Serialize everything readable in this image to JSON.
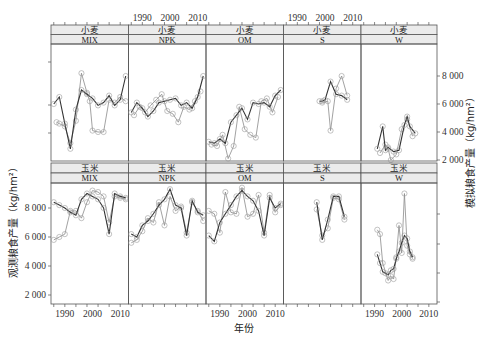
{
  "chart_data": {
    "type": "line",
    "title": "",
    "xlabel": "年份",
    "ylabel_left": "观测粮食产量（kg/hm²）",
    "ylabel_right": "模拟粮食产量（kg/hm²）",
    "x_ticks": [
      1990,
      2000,
      2010
    ],
    "x_tick_labels": [
      "1990",
      "2000",
      "2010"
    ],
    "xlim": [
      1985,
      2013
    ],
    "y_ticks": [
      2000,
      4000,
      6000,
      8000
    ],
    "y_tick_labels": [
      "2 000",
      "4 000",
      "6 000",
      "8 000"
    ],
    "legend": [],
    "series_note": "Dark line with circles = observed; light line with circles = simulated",
    "panels": [
      {
        "crop": "小麦",
        "treatment": "MIX",
        "row": 0,
        "col": 0,
        "observed": {
          "x": [
            1986,
            1988,
            1990,
            1992,
            1994,
            1996,
            1998,
            2000,
            2002,
            2004,
            2006,
            2008,
            2010,
            2012
          ],
          "y": [
            6000,
            6500,
            4600,
            2800,
            5600,
            7000,
            6700,
            6400,
            5900,
            6100,
            6600,
            5900,
            6300,
            8000
          ]
        },
        "simulated": {
          "x": [
            1987,
            1988,
            1990,
            1992,
            1994,
            1996,
            1998,
            1999,
            2000,
            2002,
            2004,
            2006,
            2008,
            2010,
            2012
          ],
          "y": [
            4700,
            4600,
            4400,
            3200,
            4800,
            8200,
            6800,
            6200,
            4100,
            4000,
            4000,
            6300,
            6100,
            6500,
            6200
          ]
        }
      },
      {
        "crop": "小麦",
        "treatment": "NPK",
        "row": 0,
        "col": 1,
        "observed": {
          "x": [
            1986,
            1988,
            1990,
            1992,
            1994,
            1996,
            1998,
            2000,
            2002,
            2004,
            2006,
            2008,
            2010,
            2012
          ],
          "y": [
            5400,
            6100,
            5700,
            5100,
            5500,
            6100,
            6200,
            6300,
            6400,
            5900,
            6100,
            5700,
            6500,
            8000
          ]
        },
        "simulated": {
          "x": [
            1987,
            1989,
            1991,
            1993,
            1995,
            1997,
            1999,
            2001,
            2003,
            2005,
            2007,
            2009,
            2011
          ],
          "y": [
            5200,
            5800,
            5400,
            5900,
            6300,
            6700,
            5500,
            5300,
            4700,
            5800,
            5600,
            6200,
            6900
          ]
        }
      },
      {
        "crop": "小麦",
        "treatment": "OM",
        "row": 0,
        "col": 2,
        "observed": {
          "x": [
            1986,
            1988,
            1990,
            1992,
            1994,
            1996,
            1998,
            2000,
            2002,
            2004,
            2006,
            2008,
            2010,
            2012
          ],
          "y": [
            3300,
            3200,
            3500,
            3200,
            4700,
            5200,
            5700,
            4900,
            6100,
            6000,
            6100,
            5800,
            6600,
            7000
          ]
        },
        "simulated": {
          "x": [
            1987,
            1989,
            1991,
            1993,
            1995,
            1997,
            1999,
            2001,
            2003,
            2005,
            2007,
            2009,
            2011
          ],
          "y": [
            3100,
            3000,
            3800,
            2100,
            3000,
            5800,
            4200,
            3800,
            3600,
            6200,
            6400,
            5400,
            6500
          ]
        }
      },
      {
        "crop": "小麦",
        "treatment": "S",
        "row": 0,
        "col": 3,
        "observed": {
          "x": [
            1998,
            1999,
            2000,
            2002,
            2004,
            2006,
            2008
          ],
          "y": [
            6200,
            6200,
            6300,
            7600,
            6700,
            6600,
            6300
          ]
        },
        "simulated": {
          "x": [
            1999,
            2001,
            2002,
            2004,
            2006,
            2008
          ],
          "y": [
            6100,
            6200,
            4100,
            7100,
            8000,
            6600
          ]
        }
      },
      {
        "crop": "小麦",
        "treatment": "W",
        "row": 0,
        "col": 4,
        "observed": {
          "x": [
            1991,
            1993,
            1994,
            1995,
            1997,
            1999,
            2001,
            2002,
            2003,
            2005
          ],
          "y": [
            2800,
            4400,
            2700,
            2900,
            2600,
            2700,
            4500,
            5100,
            4400,
            3900
          ]
        },
        "simulated": {
          "x": [
            1992,
            1994,
            1995,
            1996,
            1998,
            2000,
            2002,
            2004
          ],
          "y": [
            2500,
            3100,
            2800,
            2000,
            2400,
            4200,
            4900,
            3700
          ]
        }
      },
      {
        "crop": "玉米",
        "treatment": "MIX",
        "row": 1,
        "col": 0,
        "observed": {
          "x": [
            1986,
            1988,
            1990,
            1992,
            1994,
            1996,
            1998,
            2000,
            2002,
            2004,
            2006,
            2008,
            2010,
            2012
          ],
          "y": [
            8400,
            8200,
            8000,
            7700,
            7500,
            8600,
            9000,
            8800,
            8600,
            8000,
            6200,
            9000,
            8800,
            8700
          ]
        },
        "simulated": {
          "x": [
            1986,
            1988,
            1990,
            1992,
            1994,
            1996,
            1998,
            2000,
            2002,
            2004,
            2006,
            2008,
            2010,
            2012
          ],
          "y": [
            5800,
            6000,
            6200,
            7800,
            7800,
            7300,
            8400,
            9200,
            9100,
            8800,
            7000,
            8800,
            8700,
            8600
          ]
        }
      },
      {
        "crop": "玉米",
        "treatment": "NPK",
        "row": 1,
        "col": 1,
        "observed": {
          "x": [
            1986,
            1988,
            1990,
            1992,
            1994,
            1996,
            1998,
            2000,
            2002,
            2004,
            2006,
            2008,
            2010,
            2012
          ],
          "y": [
            6200,
            6000,
            6800,
            7100,
            7600,
            8200,
            8600,
            9300,
            8200,
            8000,
            6100,
            8500,
            7700,
            7500
          ]
        },
        "simulated": {
          "x": [
            1986,
            1988,
            1990,
            1992,
            1994,
            1996,
            1998,
            2000,
            2002,
            2004,
            2006,
            2008,
            2010,
            2012
          ],
          "y": [
            5600,
            5800,
            6400,
            7300,
            7000,
            8400,
            6800,
            8800,
            7800,
            8100,
            6300,
            8400,
            7800,
            7100
          ]
        }
      },
      {
        "crop": "玉米",
        "treatment": "OM",
        "row": 1,
        "col": 2,
        "observed": {
          "x": [
            1986,
            1988,
            1990,
            1992,
            1994,
            1996,
            1998,
            2000,
            2002,
            2004,
            2006,
            2008,
            2010,
            2012
          ],
          "y": [
            6100,
            5700,
            7000,
            7600,
            8200,
            8800,
            9200,
            8800,
            8500,
            7800,
            6100,
            8700,
            8000,
            8300
          ]
        },
        "simulated": {
          "x": [
            1986,
            1988,
            1990,
            1992,
            1994,
            1996,
            1998,
            2000,
            2002,
            2004,
            2006,
            2008,
            2010,
            2012
          ],
          "y": [
            7800,
            7600,
            6300,
            9100,
            7700,
            7600,
            9400,
            7400,
            7600,
            8900,
            6300,
            8900,
            7700,
            8200
          ]
        }
      },
      {
        "crop": "玉米",
        "treatment": "S",
        "row": 1,
        "col": 3,
        "observed": {
          "x": [
            1997,
            1999,
            2001,
            2003,
            2005,
            2007
          ],
          "y": [
            8400,
            5800,
            7200,
            8800,
            8800,
            7400
          ]
        },
        "simulated": {
          "x": [
            1997,
            1999,
            2001,
            2003,
            2005,
            2007
          ],
          "y": [
            7900,
            6100,
            6600,
            8700,
            8600,
            7200
          ]
        }
      },
      {
        "crop": "玉米",
        "treatment": "W",
        "row": 1,
        "col": 4,
        "observed": {
          "x": [
            1991,
            1992,
            1993,
            1994,
            1995,
            1996,
            1997,
            1998,
            1999,
            2000,
            2001,
            2002,
            2003,
            2004
          ],
          "y": [
            4800,
            4200,
            3600,
            3500,
            3400,
            3700,
            3800,
            4500,
            5000,
            5600,
            6100,
            5900,
            5000,
            4600
          ]
        },
        "simulated": {
          "x": [
            1991,
            1992,
            1993,
            1995,
            1996,
            1997,
            1998,
            1999,
            2000,
            2001,
            2002,
            2003,
            2004
          ],
          "y": [
            6500,
            6200,
            4200,
            3000,
            3300,
            3100,
            4600,
            6800,
            4900,
            9000,
            5400,
            4800,
            4500
          ]
        }
      }
    ]
  },
  "axes": {
    "xlabel": "年份",
    "ylabel_left": "观测粮食产量（kg/hm²）",
    "ylabel_right": "模拟粮食产量（kg/hm²）",
    "x_tick_labels": [
      "1990",
      "2000",
      "2010"
    ],
    "y_tick_labels": [
      "2 000",
      "4 000",
      "6 000",
      "8 000"
    ]
  },
  "colors": {
    "observed": "#333333",
    "simulated": "#8a8a8a",
    "strip_fill": "#ebebeb",
    "frame": "#555555"
  }
}
